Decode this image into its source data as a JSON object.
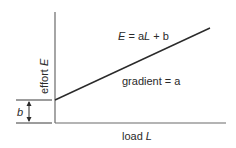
{
  "diagram": {
    "y_axis_label": {
      "text": "effort ",
      "var": "E"
    },
    "x_axis_label": {
      "text": "load ",
      "var": "L"
    },
    "equation": {
      "lhs": "E",
      "eq": " = a",
      "mid": "L",
      "rest": " + b"
    },
    "gradient_label": "gradient = a",
    "intercept_label": "b",
    "colors": {
      "line": "#2a2a2a",
      "axis": "#5a5a5a",
      "text": "#2a2a2a"
    }
  }
}
